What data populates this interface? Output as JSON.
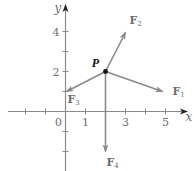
{
  "diagram": {
    "type": "vector-force-diagram",
    "axes": {
      "x_label": "x",
      "y_label": "y",
      "x_range": [
        -3,
        5.3
      ],
      "y_range": [
        -3,
        5.2
      ],
      "x_tick_values": [
        -2,
        -1,
        1,
        2,
        3,
        4,
        5
      ],
      "y_tick_values": [
        -2,
        -1,
        1,
        2,
        3,
        4
      ],
      "x_tick_labels": [
        {
          "value": 0,
          "text": "0"
        },
        {
          "value": 1,
          "text": "1"
        },
        {
          "value": 3,
          "text": "3"
        },
        {
          "value": 5,
          "text": "5"
        }
      ],
      "y_tick_labels": [
        {
          "value": 2,
          "text": "2"
        },
        {
          "value": 4,
          "text": "4"
        }
      ]
    },
    "point": {
      "label": "P",
      "x": 2,
      "y": 2
    },
    "vectors": [
      {
        "name": "F",
        "sub": "1",
        "to": [
          4.85,
          1.0
        ]
      },
      {
        "name": "F",
        "sub": "2",
        "to": [
          3.0,
          3.95
        ]
      },
      {
        "name": "F",
        "sub": "3",
        "to": [
          0.05,
          1.0
        ]
      },
      {
        "name": "F",
        "sub": "4",
        "to": [
          2.0,
          -2.0
        ]
      }
    ],
    "colors": {
      "axis": "#8a8a8a",
      "vector": "#8a8a8a",
      "text": "#6e6e6e",
      "point": "#111111"
    }
  }
}
